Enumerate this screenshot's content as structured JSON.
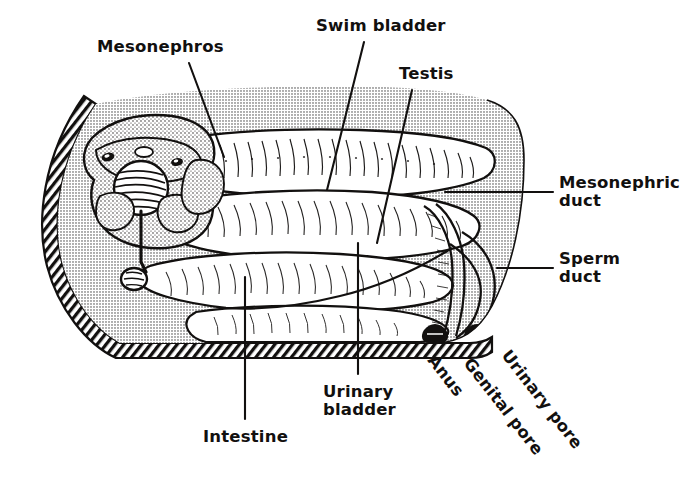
{
  "figure": {
    "type": "anatomical-diagram",
    "width": 697,
    "height": 491,
    "background_color": "#ffffff",
    "ink_color": "#12100f",
    "body_fill_color": "#c9c9c9",
    "organ_fill_color": "#ffffff"
  },
  "labels": [
    {
      "id": "mesonephros",
      "text": "Mesonephros",
      "x": 97,
      "y": 38,
      "align": "left",
      "rotation": 0,
      "leader": {
        "x1": 189,
        "y1": 63,
        "x2": 224,
        "y2": 157
      }
    },
    {
      "id": "swim-bladder",
      "text": "Swim bladder",
      "x": 316,
      "y": 17,
      "align": "left",
      "rotation": 0,
      "leader": {
        "x1": 364,
        "y1": 42,
        "x2": 327,
        "y2": 190
      }
    },
    {
      "id": "testis",
      "text": "Testis",
      "x": 399,
      "y": 65,
      "align": "left",
      "rotation": 0,
      "leader": {
        "x1": 412,
        "y1": 90,
        "x2": 377,
        "y2": 243
      }
    },
    {
      "id": "mesonephric-duct",
      "text": "Mesonephric\nduct",
      "x": 559,
      "y": 174,
      "align": "left",
      "rotation": 0,
      "leader": {
        "x1": 553,
        "y1": 192,
        "x2": 445,
        "y2": 192
      }
    },
    {
      "id": "sperm-duct",
      "text": "Sperm\nduct",
      "x": 559,
      "y": 250,
      "align": "left",
      "rotation": 0,
      "leader": {
        "x1": 553,
        "y1": 268,
        "x2": 497,
        "y2": 268
      }
    },
    {
      "id": "urinary-bladder",
      "text": "Urinary\nbladder",
      "x": 323,
      "y": 383,
      "align": "left",
      "rotation": 0,
      "leader": {
        "x1": 358,
        "y1": 374,
        "x2": 358,
        "y2": 243
      }
    },
    {
      "id": "intestine",
      "text": "Intestine",
      "x": 203,
      "y": 428,
      "align": "left",
      "rotation": 0,
      "leader": {
        "x1": 245,
        "y1": 419,
        "x2": 245,
        "y2": 277
      }
    },
    {
      "id": "anus",
      "text": "Anus",
      "x": 438,
      "y": 352,
      "align": "left",
      "rotation": 52
    },
    {
      "id": "genital-pore",
      "text": "Genital pore",
      "x": 474,
      "y": 355,
      "align": "left",
      "rotation": 52
    },
    {
      "id": "urinary-pore",
      "text": "Urinary pore",
      "x": 512,
      "y": 347,
      "align": "left",
      "rotation": 52
    }
  ],
  "structures": [
    {
      "id": "body-wall",
      "name": "body wall",
      "style": "diagonal-hatch-band"
    },
    {
      "id": "body-cavity",
      "name": "body cavity",
      "style": "gray-halftone-fill"
    },
    {
      "id": "mesonephros-organ",
      "name": "mesonephros (kidney)",
      "style": "stippled-lobed-mass"
    },
    {
      "id": "glomerulus-coil",
      "name": "coiled renal corpuscle",
      "style": "concentric-coil"
    },
    {
      "id": "swim-bladder-organ",
      "name": "swim bladder",
      "style": "elongate-hatched-sac"
    },
    {
      "id": "testis-organ",
      "name": "testis",
      "style": "elongate-hatched-lobe"
    },
    {
      "id": "intestine-organ",
      "name": "intestine",
      "style": "elongate-hatched-tube"
    },
    {
      "id": "urinary-bladder-organ",
      "name": "urinary bladder",
      "style": "rounded-sac"
    },
    {
      "id": "mesonephric-duct-tube",
      "name": "mesonephric duct",
      "style": "thin-double-line-duct"
    },
    {
      "id": "sperm-duct-tube",
      "name": "sperm duct",
      "style": "thin-double-line-duct"
    },
    {
      "id": "anus-pore",
      "name": "anus",
      "style": "dark-pore-opening"
    },
    {
      "id": "genital-pore-opening",
      "name": "genital pore",
      "style": "dark-pore-opening"
    },
    {
      "id": "urinary-pore-opening",
      "name": "urinary pore",
      "style": "dark-pore-opening"
    }
  ]
}
